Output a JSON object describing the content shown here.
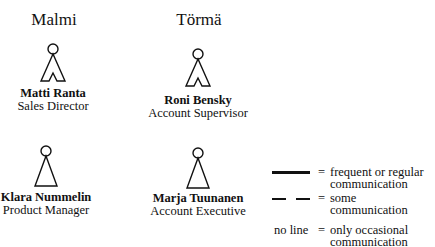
{
  "groups": [
    {
      "label": "Malmi"
    },
    {
      "label": "Törmä"
    }
  ],
  "people": [
    {
      "name": "Matti Ranta",
      "title": "Sales Director",
      "figure": "male",
      "group": "Malmi"
    },
    {
      "name": "Roni Bensky",
      "title": "Account Supervisor",
      "figure": "male",
      "group": "Törmä"
    },
    {
      "name": "Klara Nummelin",
      "title": "Product Manager",
      "figure": "female",
      "group": "Malmi"
    },
    {
      "name": "Marja Tuunanen",
      "title": "Account Executive",
      "figure": "female",
      "group": "Törmä"
    }
  ],
  "legend": {
    "items": [
      {
        "symbol": "solid-line",
        "equals": "=",
        "text": "frequent or regular communication"
      },
      {
        "symbol": "dashed-line",
        "equals": "=",
        "text": "some communication"
      },
      {
        "symbol": "no line",
        "equals": "=",
        "text": "only occasional communication"
      }
    ]
  }
}
